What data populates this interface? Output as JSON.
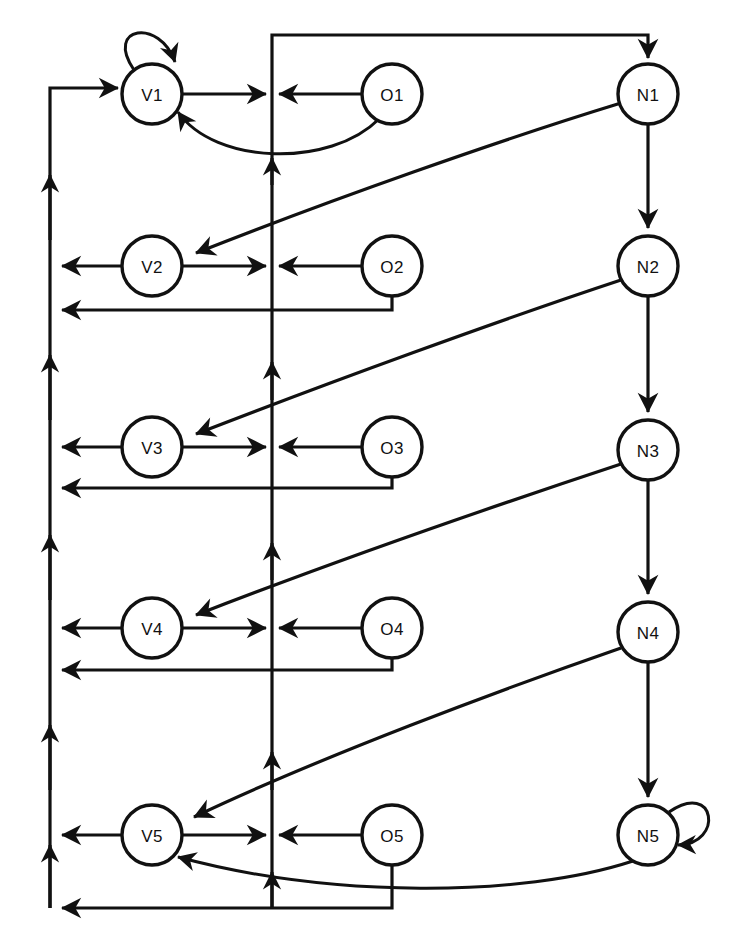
{
  "diagram": {
    "canvas": {
      "width": 746,
      "height": 949
    },
    "style": {
      "stroke_color": "#111111",
      "fill_color": "#ffffff",
      "stroke_width": 3.2,
      "node_radius": 30,
      "label_font_size": 17
    },
    "columns": [
      {
        "id": "V",
        "x": 152,
        "label_prefix": "V"
      },
      {
        "id": "O",
        "x": 392,
        "label_prefix": "O"
      },
      {
        "id": "N",
        "x": 648,
        "label_prefix": "N"
      }
    ],
    "rows_y": [
      94,
      266,
      447,
      628,
      835
    ],
    "bus": {
      "left_x": 50,
      "center_x": 272,
      "top_y": 88,
      "bottom_y": 908,
      "return_offsets": [
        0,
        44,
        41,
        42,
        73
      ]
    },
    "nodes": [
      {
        "id": "V1",
        "label": "V1",
        "cx": 152,
        "cy": 94
      },
      {
        "id": "V2",
        "label": "V2",
        "cx": 152,
        "cy": 266
      },
      {
        "id": "V3",
        "label": "V3",
        "cx": 152,
        "cy": 447
      },
      {
        "id": "V4",
        "label": "V4",
        "cx": 152,
        "cy": 628
      },
      {
        "id": "V5",
        "label": "V5",
        "cx": 152,
        "cy": 835
      },
      {
        "id": "O1",
        "label": "O1",
        "cx": 392,
        "cy": 94
      },
      {
        "id": "O2",
        "label": "O2",
        "cx": 392,
        "cy": 266
      },
      {
        "id": "O3",
        "label": "O3",
        "cx": 392,
        "cy": 447
      },
      {
        "id": "O4",
        "label": "O4",
        "cx": 392,
        "cy": 628
      },
      {
        "id": "O5",
        "label": "O5",
        "cx": 392,
        "cy": 835
      },
      {
        "id": "N1",
        "label": "N1",
        "cx": 648,
        "cy": 94
      },
      {
        "id": "N2",
        "label": "N2",
        "cx": 648,
        "cy": 266
      },
      {
        "id": "N3",
        "label": "N3",
        "cx": 648,
        "cy": 450
      },
      {
        "id": "N4",
        "label": "N4",
        "cx": 648,
        "cy": 632
      },
      {
        "id": "N5",
        "label": "N5",
        "cx": 648,
        "cy": 835
      }
    ],
    "self_loops": [
      {
        "node": "V1",
        "side": "top-left"
      },
      {
        "node": "N5",
        "side": "right"
      }
    ],
    "chain_edges": [
      {
        "from": "N1",
        "to": "N2"
      },
      {
        "from": "N2",
        "to": "N3"
      },
      {
        "from": "N3",
        "to": "N4"
      },
      {
        "from": "N4",
        "to": "N5"
      }
    ],
    "diagonal_edges": [
      {
        "from": "N1",
        "to": "V2"
      },
      {
        "from": "N2",
        "to": "V3"
      },
      {
        "from": "N3",
        "to": "V4"
      },
      {
        "from": "N4",
        "to": "V5"
      }
    ],
    "feedback_curves": [
      {
        "from": "O1",
        "to": "V1"
      },
      {
        "from": "N5",
        "to": "V5"
      }
    ],
    "row_edges": [
      {
        "from": "V1",
        "to": "center-bus",
        "direction": "right"
      },
      {
        "from": "O1",
        "to": "center-bus",
        "direction": "left"
      },
      {
        "from": "V2",
        "to": "center-bus",
        "direction": "right"
      },
      {
        "from": "O2",
        "to": "center-bus",
        "direction": "left"
      },
      {
        "from": "V3",
        "to": "center-bus",
        "direction": "right"
      },
      {
        "from": "O3",
        "to": "center-bus",
        "direction": "left"
      },
      {
        "from": "V4",
        "to": "center-bus",
        "direction": "right"
      },
      {
        "from": "O4",
        "to": "center-bus",
        "direction": "left"
      },
      {
        "from": "V5",
        "to": "center-bus",
        "direction": "right"
      },
      {
        "from": "O5",
        "to": "center-bus",
        "direction": "left"
      }
    ],
    "left_bus_edges": [
      {
        "from": "V2",
        "to": "left-bus"
      },
      {
        "from": "V3",
        "to": "left-bus"
      },
      {
        "from": "V4",
        "to": "left-bus"
      },
      {
        "from": "V5",
        "to": "left-bus"
      }
    ],
    "return_edges": [
      {
        "from": "O2",
        "to": "left-bus"
      },
      {
        "from": "O3",
        "to": "left-bus"
      },
      {
        "from": "O4",
        "to": "left-bus"
      },
      {
        "from": "O5",
        "to": "left-bus"
      }
    ]
  }
}
